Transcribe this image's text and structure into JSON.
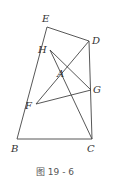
{
  "figure": {
    "caption": "图 19 - 6",
    "points": {
      "E": {
        "label": "E",
        "x": 47,
        "y": 27,
        "lx": 42,
        "ly": 22
      },
      "D": {
        "label": "D",
        "x": 89,
        "y": 41,
        "lx": 92,
        "ly": 44
      },
      "H": {
        "label": "H",
        "x": 50,
        "y": 50,
        "lx": 38,
        "ly": 53
      },
      "A": {
        "label": "A",
        "x": 54,
        "y": 71,
        "lx": 57,
        "ly": 77
      },
      "G": {
        "label": "G",
        "x": 91,
        "y": 90,
        "lx": 93,
        "ly": 93
      },
      "F": {
        "label": "F",
        "x": 36,
        "y": 104,
        "lx": 25,
        "ly": 109
      },
      "B": {
        "label": "B",
        "x": 17,
        "y": 139,
        "lx": 11,
        "ly": 152
      },
      "C": {
        "label": "C",
        "x": 92,
        "y": 139,
        "lx": 87,
        "ly": 152
      }
    },
    "segments": [
      [
        "E",
        "D"
      ],
      [
        "E",
        "B"
      ],
      [
        "D",
        "C"
      ],
      [
        "D",
        "F"
      ],
      [
        "H",
        "C"
      ],
      [
        "H",
        "G"
      ],
      [
        "F",
        "G"
      ],
      [
        "B",
        "C"
      ]
    ]
  }
}
